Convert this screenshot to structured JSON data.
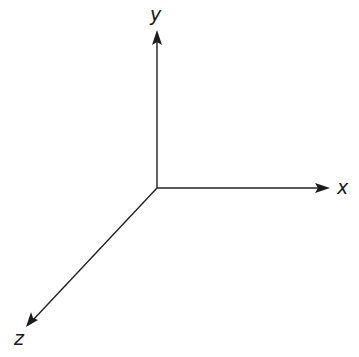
{
  "diagram": {
    "title": "",
    "origin": {
      "x": 157,
      "y": 188
    },
    "axes": [
      {
        "id": "y",
        "label": "y",
        "direction": "up",
        "end": {
          "x": 157,
          "y": 30
        }
      },
      {
        "id": "x",
        "label": "x",
        "direction": "right",
        "end": {
          "x": 330,
          "y": 188
        }
      },
      {
        "id": "z",
        "label": "z",
        "direction": "down-left",
        "end": {
          "x": 26,
          "y": 327
        }
      }
    ],
    "colors": {
      "stroke": "#222222",
      "background": "#ffffff"
    }
  }
}
